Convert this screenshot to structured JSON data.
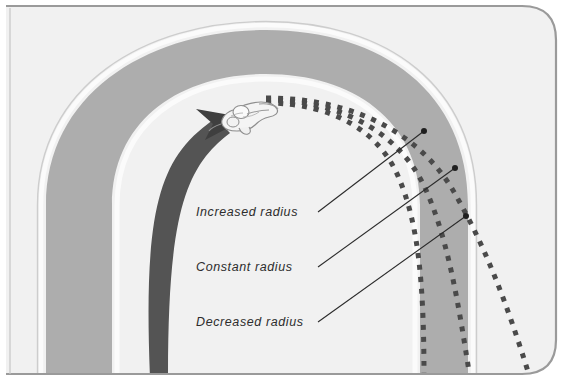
{
  "figure": {
    "name": "cornering-line-diagram",
    "caption_labels": [
      {
        "id": "increased-radius",
        "text": "Increased  radius",
        "x": 196,
        "y": 216
      },
      {
        "id": "constant-radius",
        "text": "Constant  radius",
        "x": 196,
        "y": 271
      },
      {
        "id": "decreased-radius",
        "text": "Decreased  radius",
        "x": 196,
        "y": 326
      }
    ],
    "leader_lines": [
      {
        "id": "leader-increased",
        "from_x": 318,
        "from_y": 212,
        "to_x": 424,
        "to_y": 131
      },
      {
        "id": "leader-constant",
        "from_x": 318,
        "from_y": 267,
        "to_x": 455,
        "to_y": 168
      },
      {
        "id": "leader-decreased",
        "from_x": 318,
        "from_y": 322,
        "to_x": 466,
        "to_y": 216
      }
    ],
    "vehicle": {
      "id": "motorcycle-rider",
      "x": 245,
      "y": 118,
      "label": "motorcycle-rider-icon"
    },
    "direction_arrow": {
      "id": "travel-direction-arrow",
      "label": "curved-arrow-icon",
      "tip_x": 211,
      "tip_y": 130
    },
    "dotted_paths": [
      {
        "id": "path-increased-radius",
        "label": "Increased radius line"
      },
      {
        "id": "path-constant-radius",
        "label": "Constant radius line"
      },
      {
        "id": "path-decreased-radius",
        "label": "Decreased radius line"
      }
    ]
  },
  "colors": {
    "page_background": "#ffffff",
    "panel_background": "#f1f1f1",
    "panel_border": "#9a9a9a",
    "road_gray": "#adadad",
    "road_edge_white": "#fbfbfb",
    "arrow_dark": "#545454",
    "dotted_line": "#4a4a4a",
    "leader_line": "#2b2b2b",
    "text": "#2d2d2d",
    "vehicle_fill": "#f4f4f4",
    "vehicle_stroke": "#8e8e8e"
  }
}
